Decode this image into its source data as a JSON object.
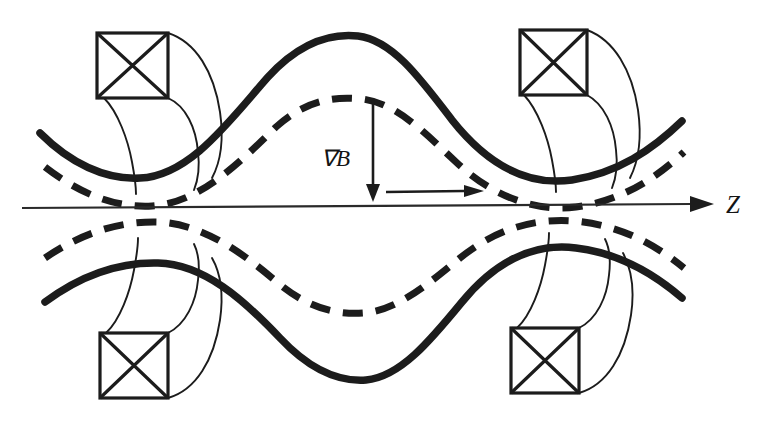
{
  "figure": {
    "background_color": "#ffffff",
    "ink_color": "#1c1c1c"
  },
  "labels": {
    "axis_label": "Z",
    "gradient_label": "∇B"
  },
  "axis": {
    "name": "z-axis",
    "start_x": 22,
    "end_x": 700,
    "y": 206,
    "arrow": "right",
    "label": "Z",
    "label_x": 718,
    "label_y": 214
  },
  "annotations": [
    {
      "name": "grad-b-arrow",
      "label": "∇B",
      "direction": "down",
      "from_x": 373,
      "from_y": 103,
      "to_x": 373,
      "to_y": 196,
      "label_x": 322,
      "label_y": 168
    },
    {
      "name": "drift-arrow",
      "label": "",
      "direction": "right",
      "from_x": 386,
      "from_y": 192,
      "to_x": 474,
      "to_y": 192
    }
  ],
  "coils": [
    {
      "name": "coil-top-left",
      "x": 97,
      "y": 33,
      "w": 71,
      "h": 65,
      "quadrant": "top-left"
    },
    {
      "name": "coil-top-right",
      "x": 520,
      "y": 30,
      "w": 67,
      "h": 65,
      "quadrant": "top-right"
    },
    {
      "name": "coil-bottom-left",
      "x": 100,
      "y": 333,
      "w": 68,
      "h": 65,
      "quadrant": "bottom-left"
    },
    {
      "name": "coil-bottom-right",
      "x": 511,
      "y": 328,
      "w": 68,
      "h": 65,
      "quadrant": "bottom-right"
    }
  ],
  "field_lines": [
    {
      "name": "upper-solid-fieldline",
      "style": "solid",
      "position": "upper-outer",
      "path": "M 40 133 C 70 163, 105 180, 140 178 C 190 176, 230 120, 268 77 C 300 42, 330 33, 358 36 C 392 40, 420 78, 452 120 C 490 168, 530 186, 572 180 C 618 173, 652 150, 682 121"
    },
    {
      "name": "upper-dashed-fieldline",
      "style": "dashed",
      "position": "upper-inner",
      "path": "M 45 167 C 80 194, 115 208, 152 206 C 200 203, 240 162, 276 127 C 306 100, 334 96, 362 99 C 396 103, 424 132, 456 162 C 492 196, 534 212, 576 207 C 620 201, 654 180, 684 152"
    },
    {
      "name": "lower-dashed-fieldline",
      "style": "dashed",
      "position": "lower-inner",
      "path": "M 45 258 C 80 234, 118 221, 158 222 C 204 224, 244 254, 278 283 C 308 308, 336 315, 364 313 C 398 310, 428 284, 460 258 C 496 229, 534 218, 574 221 C 618 225, 652 242, 684 268"
    },
    {
      "name": "lower-solid-fieldline",
      "style": "solid",
      "position": "lower-outer",
      "path": "M 45 302 C 80 276, 118 262, 158 263 C 204 264, 244 300, 280 338 C 310 370, 338 382, 366 380 C 400 377, 430 341, 462 302 C 498 258, 536 243, 576 248 C 618 253, 652 272, 682 298"
    }
  ]
}
